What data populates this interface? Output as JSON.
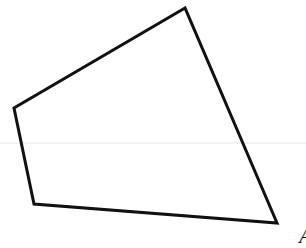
{
  "diagram": {
    "type": "quadrilateral",
    "stroke_color": "#111111",
    "background": "#ffffff",
    "vertices": [
      {
        "x": 185,
        "y": 8
      },
      {
        "x": 14,
        "y": 108
      },
      {
        "x": 34,
        "y": 204
      },
      {
        "x": 277,
        "y": 223
      }
    ],
    "labels": [
      {
        "text": "A",
        "x": 299,
        "y": 225
      }
    ]
  }
}
